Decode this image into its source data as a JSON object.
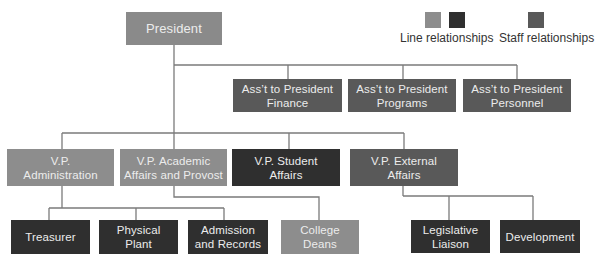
{
  "legend": {
    "line_label": "Line relationships",
    "staff_label": "Staff relationships",
    "colors": {
      "line_light": "#8d8d8d",
      "line_dark": "#2f2f2f",
      "staff": "#595959"
    }
  },
  "president": {
    "label": "President"
  },
  "assistants": [
    {
      "line1": "Ass’t to President",
      "line2": "Finance"
    },
    {
      "line1": "Ass’t  to President",
      "line2": "Programs"
    },
    {
      "line1": "Ass’t to President",
      "line2": "Personnel"
    }
  ],
  "vps": [
    {
      "line1": "V.P.",
      "line2": "Administration"
    },
    {
      "line1": "V.P. Academic",
      "line2": "Affairs and Provost"
    },
    {
      "line1": "V.P. Student",
      "line2": "Affairs"
    },
    {
      "line1": "V.P. External",
      "line2": "Affairs"
    }
  ],
  "units": [
    {
      "line1": "Treasurer",
      "line2": ""
    },
    {
      "line1": "Physical",
      "line2": "Plant"
    },
    {
      "line1": "Admission",
      "line2": "and Records"
    },
    {
      "line1": "College",
      "line2": "Deans"
    },
    {
      "line1": "Legislative",
      "line2": "Liaison"
    },
    {
      "line1": "Development",
      "line2": ""
    }
  ]
}
